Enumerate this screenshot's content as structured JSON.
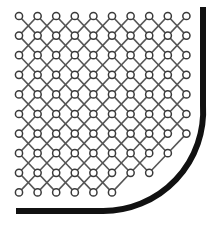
{
  "diagram": {
    "type": "lattice-in-rounded-container",
    "lattice": {
      "columns": 10,
      "rows": 10,
      "origin_x": 19,
      "origin_y": 16,
      "spacing_x": 18.6,
      "spacing_y": 19.6,
      "node_radius": 3.6,
      "node_stroke": "#3a3a3a",
      "link_stroke": "#555555",
      "link_width": 1.6,
      "clip_center": [
        103,
        105
      ],
      "clip_radius": 91,
      "max_x": 191
    },
    "boundary": {
      "color": "#111111",
      "thickness": 6,
      "vertical_x": 203,
      "top_y": 7,
      "arc_center": [
        103,
        105
      ],
      "arc_radius": 100,
      "bottom_y": 211,
      "left_x": 16
    }
  }
}
